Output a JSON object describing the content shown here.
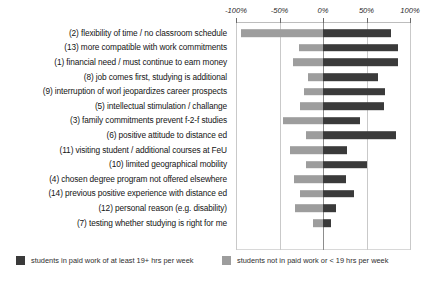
{
  "chart_data": {
    "type": "bar",
    "orientation": "horizontal",
    "style": "diverging-paired",
    "title": "",
    "xlabel": "",
    "ylabel": "",
    "xlim": [
      -100,
      100
    ],
    "grid": true,
    "legend_position": "bottom",
    "axis_ticks": [
      {
        "label": "-100%",
        "value": -100
      },
      {
        "label": "-50%",
        "value": -50
      },
      {
        "label": "0%",
        "value": 0
      },
      {
        "label": "50%",
        "value": 50
      },
      {
        "label": "100%",
        "value": 100
      }
    ],
    "categories": [
      "(2) flexibility of time / no classroom schedule",
      "(13) more compatible with work commitments",
      "(1) financial need / must continue to earn money",
      "(8) job comes first, studying is additional",
      "(9) interruption of worl jeopardizes career prospects",
      "(5) intellectual stimulation / challange",
      "(3) family commitments prevent f-2-f studies",
      "(6) positive attitude to distance ed",
      "(11) visiting student / additional courses at FeU",
      "(10) limited geographical mobility",
      "(4) chosen degree program not offered elsewhere",
      "(14) previous positive experience with distance ed",
      "(12) personal reason (e.g. disability)",
      "(7) testing whether studying is right for me"
    ],
    "series": [
      {
        "name": "students in paid work of at least 19+ hrs per week",
        "color": "#3a3a3a",
        "direction": "positive",
        "values": [
          78,
          86,
          86,
          63,
          71,
          70,
          43,
          84,
          28,
          50,
          26,
          36,
          15,
          9
        ]
      },
      {
        "name": "students not in paid work or < 19 hrs per week",
        "color": "#9d9d9d",
        "direction": "negative",
        "values": [
          -94,
          -28,
          -35,
          -17,
          -22,
          -27,
          -46,
          -20,
          -38,
          -20,
          -33,
          -26,
          -32,
          -11
        ]
      }
    ]
  },
  "legend": {
    "items": [
      {
        "label": "students in paid work of at least 19+ hrs per week",
        "color": "#3a3a3a"
      },
      {
        "label": "students not in paid work or < 19 hrs per week",
        "color": "#9d9d9d"
      }
    ]
  }
}
